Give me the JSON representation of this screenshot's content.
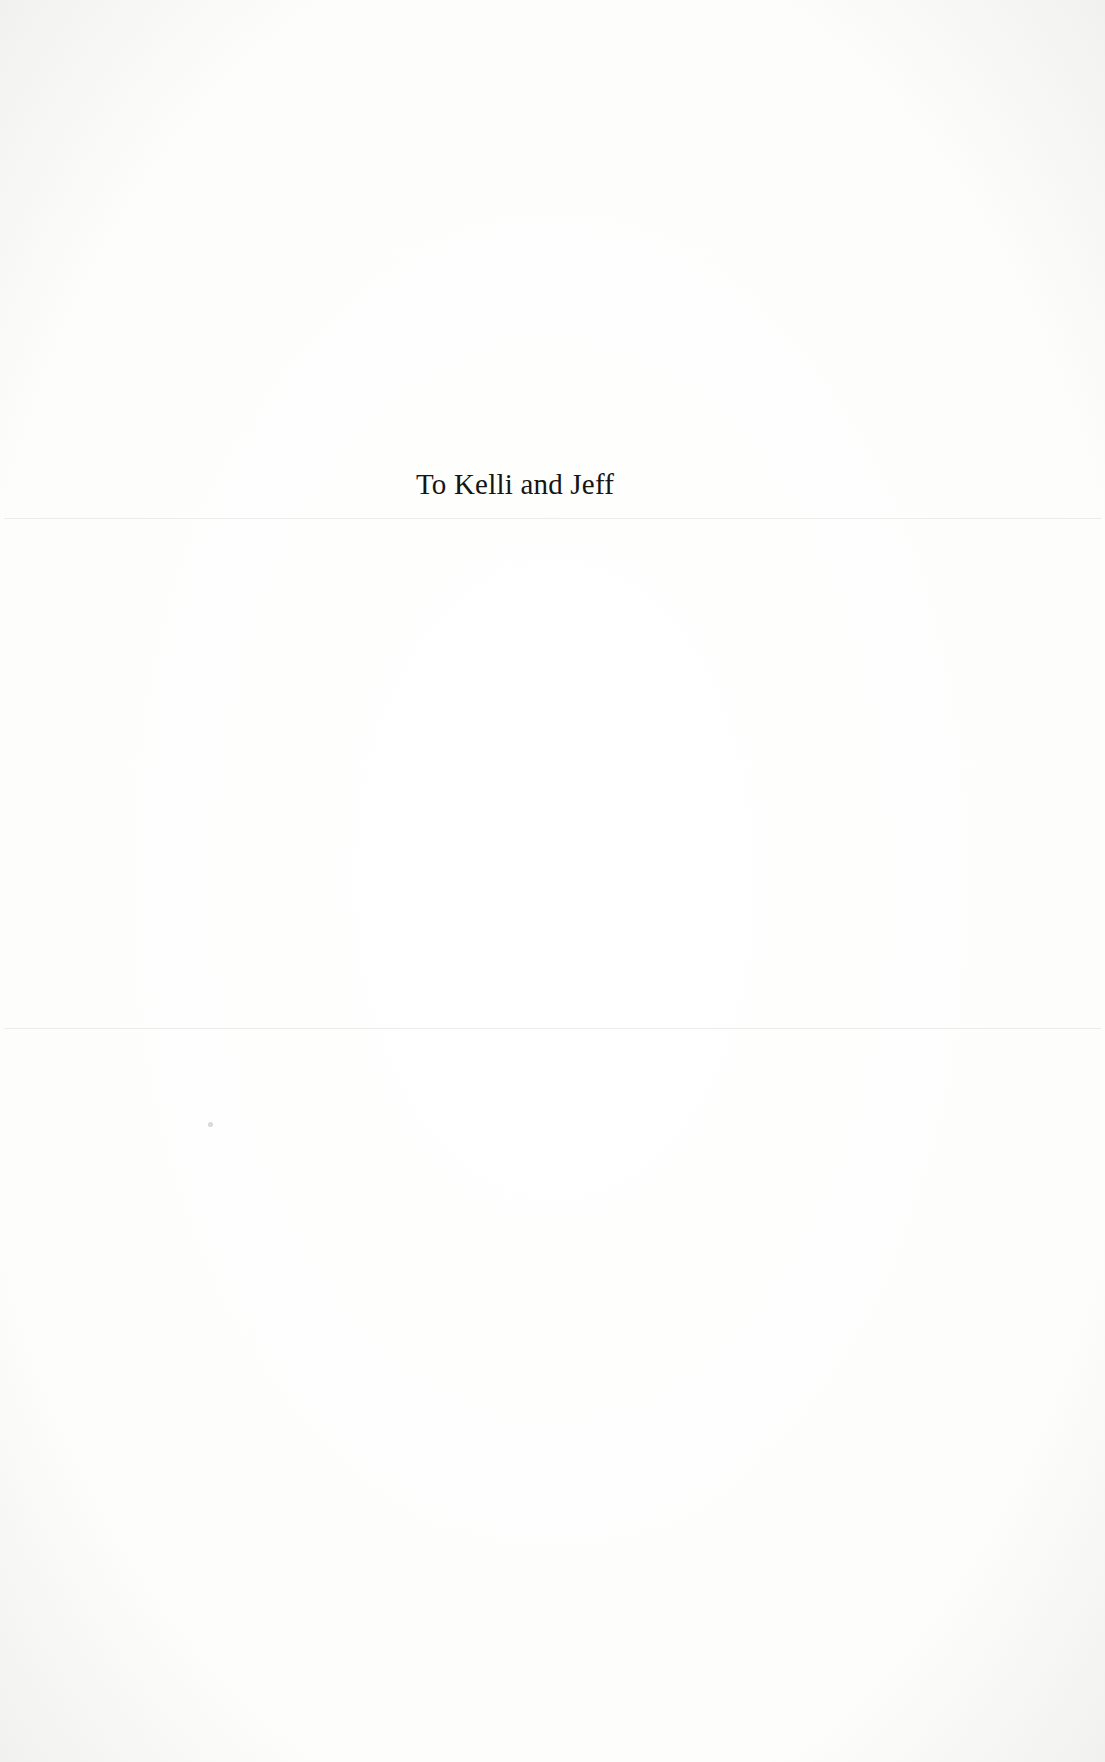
{
  "page": {
    "dedication": "To Kelli and Jeff"
  }
}
